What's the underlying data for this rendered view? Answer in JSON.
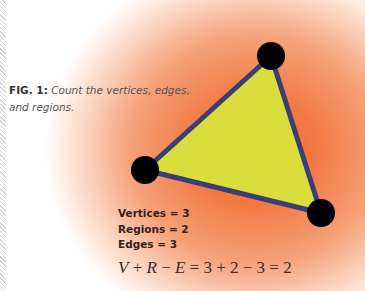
{
  "caption": {
    "label": "FIG. 1:",
    "text": " Count the vertices, edges, and regions."
  },
  "diagram": {
    "shape": "triangle",
    "vertices": [
      {
        "name": "top",
        "x": 271,
        "y": 56
      },
      {
        "name": "left",
        "x": 145,
        "y": 170
      },
      {
        "name": "bottom-right",
        "x": 321,
        "y": 213
      }
    ],
    "fill_color": "#dbdd3c",
    "edge_color": "#3b3e74",
    "vertex_color": "#000000",
    "background_glow_color": "#f2662f"
  },
  "counts": {
    "vertices": "Vertices = 3",
    "regions": "Regions = 2",
    "edges": "Edges = 3"
  },
  "formula": {
    "lhs_V": "V",
    "lhs_plus": " + ",
    "lhs_R": "R",
    "lhs_minus": " − ",
    "lhs_E": "E",
    "rhs": " = 3 + 2 − 3 = 2"
  }
}
